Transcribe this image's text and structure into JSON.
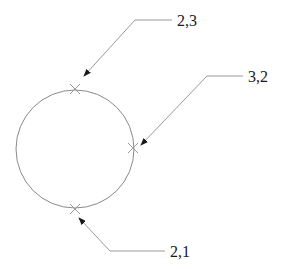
{
  "diagram": {
    "type": "circle-with-callouts",
    "circle": {
      "cx": 75,
      "cy": 149,
      "r": 59,
      "stroke": "#8a8a8a"
    },
    "markers": [
      {
        "name": "top-point",
        "x": 75,
        "y": 89
      },
      {
        "name": "right-point",
        "x": 133,
        "y": 148
      },
      {
        "name": "bottom-point",
        "x": 75,
        "y": 209
      }
    ],
    "callouts": [
      {
        "label": "2,3",
        "target": "top-point"
      },
      {
        "label": "3,2",
        "target": "right-point"
      },
      {
        "label": "2,1",
        "target": "bottom-point"
      }
    ],
    "colors": {
      "line": "#9a9a9a",
      "arrow": "#1a1a1a",
      "text": "#1a1a1a",
      "background": "#ffffff"
    }
  }
}
